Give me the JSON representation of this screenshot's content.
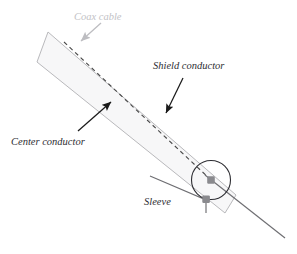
{
  "figure": {
    "background_color": "#ffffff"
  },
  "colors": {
    "cable_outline": "#b9b9bc",
    "cable_fill": "#f7f7f8",
    "center_conductor": "#3a3a3a",
    "dashed_conductor": "#4a4a4a",
    "sleeve_line": "#6e6e72",
    "marker_fill": "#8a8a8e",
    "label_dark": "#2e2e33",
    "label_light": "#c2c2c6",
    "arrow_dark": "#1a1a1a",
    "arrow_light": "#bdbdc1"
  },
  "labels": {
    "coax_cable": "Coax cable",
    "shield_conductor": "Shield conductor",
    "center_conductor": "Center conductor",
    "sleeve": "Sleeve"
  },
  "icons": {
    "coax_cable_arrow": "arrow-down-left-icon",
    "shield_arrow": "arrow-down-left-icon",
    "center_arrow": "arrow-up-right-icon",
    "center_marker": "square-dot-icon",
    "sleeve_marker": "square-dot-icon"
  },
  "geometry": {
    "cable_body": "M48,32 L236,195 L225,213 L37,62 Z",
    "end_circle": {
      "cx": 211,
      "cy": 180,
      "r": 19.5
    },
    "dashed_axis": {
      "x1": 64,
      "y1": 42,
      "x2": 211,
      "y2": 180
    },
    "center_conductor_tail": {
      "x1": 211,
      "y1": 180,
      "x2": 285,
      "y2": 238
    },
    "sleeve_path": "M150,176 L206,200 L206,212",
    "markers": [
      {
        "name": "center-conductor-marker",
        "cx": 211,
        "cy": 180
      },
      {
        "name": "sleeve-marker",
        "cx": 198,
        "cy": 199
      }
    ]
  },
  "annotations": [
    {
      "id": "coax-cable",
      "label_x": 74,
      "label_y": 22,
      "arrow": {
        "x1": 101,
        "y1": 23,
        "x2": 80,
        "y2": 41
      }
    },
    {
      "id": "shield-conductor",
      "label_x": 155,
      "label_y": 72,
      "arrow": {
        "x1": 183,
        "y1": 78,
        "x2": 165,
        "y2": 114
      }
    },
    {
      "id": "center-conductor",
      "label_x": 12,
      "label_y": 148,
      "arrow": {
        "x1": 78,
        "y1": 131,
        "x2": 112,
        "y2": 101
      }
    },
    {
      "id": "sleeve",
      "label_x": 145,
      "label_y": 208,
      "arrow": null
    }
  ]
}
